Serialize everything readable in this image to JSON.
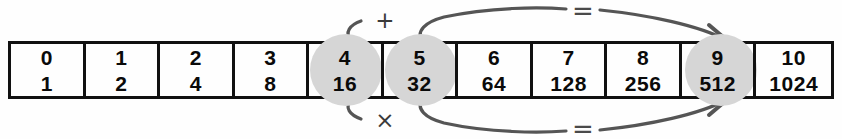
{
  "diagram": {
    "stroke_color": "#555555",
    "highlight_color": "#d6d6d6",
    "border_color": "#111111",
    "text_color": "#0a0a0a",
    "background_color": "#fefefe"
  },
  "table": {
    "columns": 11,
    "rows": [
      {
        "name": "exponent-row",
        "values": [
          "0",
          "1",
          "2",
          "3",
          "4",
          "5",
          "6",
          "7",
          "8",
          "9",
          "10"
        ]
      },
      {
        "name": "power-row",
        "values": [
          "1",
          "2",
          "4",
          "8",
          "16",
          "32",
          "64",
          "128",
          "256",
          "512",
          "1024"
        ]
      }
    ],
    "highlighted_columns": [
      4,
      5,
      9
    ]
  },
  "annotations": {
    "top": {
      "operator": "+",
      "relation": "=",
      "from_columns": [
        4,
        5
      ],
      "to_column": 9,
      "meaning": "4 + 5 = 9"
    },
    "bottom": {
      "operator": "×",
      "relation": "=",
      "from_columns": [
        4,
        5
      ],
      "to_column": 9,
      "meaning": "16 × 32 = 512"
    }
  }
}
